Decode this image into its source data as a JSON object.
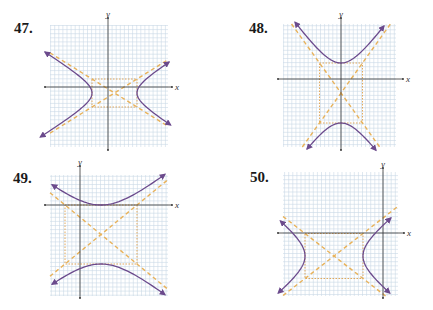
{
  "problems": [
    {
      "number": "47.",
      "x_axis_label": "x",
      "y_axis_label": "y",
      "orientation": "horizontal",
      "grid": {
        "left": 50,
        "top": 25,
        "right": 168,
        "bottom": 147
      },
      "axes": {
        "x_axis_y": 87,
        "x_from": 45,
        "x_to": 172,
        "y_axis_x": 108,
        "y_from": 18,
        "y_to": 150
      },
      "center": [
        114.5,
        93
      ],
      "a": 22.5,
      "b": 14,
      "arrow_ends": {
        "left_top": [
          52,
          52
        ],
        "left_bottom": [
          52,
          137
        ],
        "right_top": [
          163,
          62
        ],
        "right_bottom": [
          163,
          125
        ]
      },
      "label_pos": [
        14,
        22
      ]
    },
    {
      "number": "48.",
      "x_axis_label": "x",
      "y_axis_label": "y",
      "orientation": "vertical",
      "grid": {
        "left": 283,
        "top": 24,
        "right": 396,
        "bottom": 147
      },
      "axes": {
        "x_axis_y": 79,
        "x_from": 278,
        "x_to": 403,
        "y_axis_x": 341,
        "y_from": 18,
        "y_to": 150
      },
      "center": [
        341,
        93
      ],
      "a": 30,
      "b": 21.5,
      "arrow_ends": {
        "left_top": [
          295,
          26
        ],
        "right_top": [
          384,
          26
        ],
        "left_bottom": [
          307,
          144
        ],
        "right_bottom": [
          376,
          144
        ]
      },
      "label_pos": [
        249,
        22
      ]
    },
    {
      "number": "49.",
      "x_axis_label": "x",
      "y_axis_label": "y",
      "orientation": "vertical",
      "grid": {
        "left": 50,
        "top": 175,
        "right": 168,
        "bottom": 296
      },
      "axes": {
        "x_axis_y": 205,
        "x_from": 45,
        "x_to": 172,
        "y_axis_x": 80,
        "y_from": 166,
        "y_to": 298
      },
      "center": [
        101,
        234.5
      ],
      "a": 29.5,
      "b": 36,
      "arrow_ends": {
        "left_top": [
          52,
          184
        ],
        "right_top": [
          165,
          176
        ],
        "left_bottom": [
          52,
          287
        ],
        "right_bottom": [
          165,
          293
        ]
      },
      "label_pos": [
        13,
        172
      ]
    },
    {
      "number": "50.",
      "x_axis_label": "x",
      "y_axis_label": "y",
      "orientation": "horizontal",
      "grid": {
        "left": 283,
        "top": 172,
        "right": 398,
        "bottom": 296
      },
      "axes": {
        "x_axis_y": 233,
        "x_from": 278,
        "x_to": 404,
        "y_axis_x": 383,
        "y_from": 168,
        "y_to": 298
      },
      "center": [
        334,
        256
      ],
      "a": 29,
      "b": 22.5,
      "arrow_ends": {
        "left_top": [
          285,
          221
        ],
        "left_bottom": [
          285,
          293
        ],
        "right_top": [
          395,
          218
        ],
        "right_bottom": [
          385,
          293
        ]
      },
      "label_pos": [
        250,
        171
      ]
    }
  ],
  "colors": {
    "grid_bg": "#ffffff",
    "grid_line": "#c9d9e6",
    "axis": "#333333",
    "hyperbola": "#6b4a8c",
    "asymptote": "#e8b25a",
    "rectangle": "#e0a04c"
  }
}
